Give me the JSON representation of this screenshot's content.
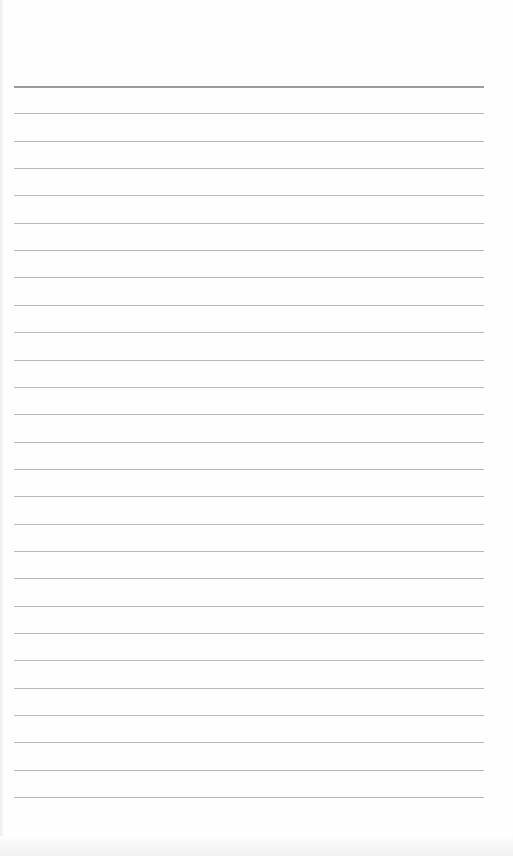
{
  "document": {
    "type": "lined-paper",
    "line_count": 27,
    "first_line_y": 86,
    "line_spacing": 27.35,
    "line_left": 14,
    "line_width": 470,
    "line_color": "#b9b9b9",
    "header_line_color": "#9a9a9a",
    "paper_color": "#fefefe"
  }
}
